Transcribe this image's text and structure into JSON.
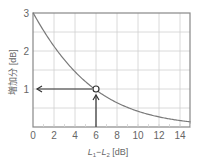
{
  "chart_data": {
    "type": "line",
    "title": "",
    "xlabel": "L1−L2 [dB]",
    "ylabel": "増加分 [dB]",
    "xlim": [
      0,
      15
    ],
    "ylim": [
      0,
      3
    ],
    "x_ticks": [
      "0",
      "2",
      "4",
      "6",
      "8",
      "10",
      "12",
      "14"
    ],
    "y_ticks": [
      "1",
      "2",
      "3"
    ],
    "grid": true,
    "series": [
      {
        "name": "level increase",
        "x": [
          0,
          1,
          2,
          3,
          4,
          5,
          6,
          7,
          8,
          9,
          10,
          11,
          12,
          13,
          14,
          15
        ],
        "values": [
          3.01,
          2.54,
          2.12,
          1.76,
          1.46,
          1.19,
          0.97,
          0.79,
          0.64,
          0.51,
          0.41,
          0.33,
          0.27,
          0.21,
          0.17,
          0.14
        ]
      }
    ],
    "annotations": [
      {
        "type": "marker",
        "x": 6,
        "y": 1,
        "shape": "circle"
      },
      {
        "type": "arrow",
        "from": [
          6,
          0
        ],
        "to": [
          6,
          1
        ],
        "direction": "up"
      },
      {
        "type": "arrow",
        "from": [
          6,
          1
        ],
        "to": [
          0,
          1
        ],
        "direction": "left"
      }
    ]
  },
  "labels": {
    "x_axis_label": {
      "main": "L",
      "sub1": "1",
      "minus": "−",
      "main2": "L",
      "sub2": "2",
      "unit": " [dB]"
    },
    "y_axis_label": "増加分 [dB]",
    "x_ticks": [
      "0",
      "2",
      "4",
      "6",
      "8",
      "10",
      "12",
      "14"
    ],
    "y_ticks": [
      "1",
      "2",
      "3"
    ]
  },
  "colors": {
    "axis": "#888888",
    "grid": "#d0d0d0",
    "curve": "#7a7a7a",
    "arrow": "#333333",
    "text": "#666666"
  }
}
